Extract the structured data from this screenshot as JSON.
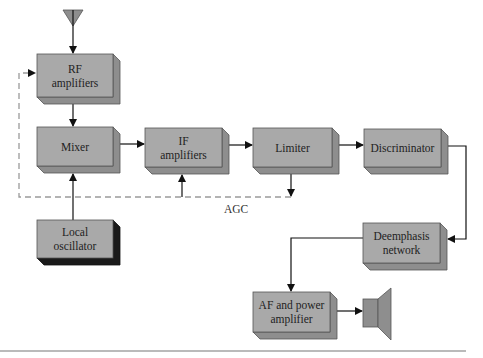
{
  "diagram": {
    "colors": {
      "block_front": "#a9a9a9",
      "block_side": "#8e8e8e",
      "oscillator_side": "#1a1a1a",
      "wire": "#111111",
      "agc_dashed": "#9a9a9a"
    },
    "blocks": [
      {
        "id": "rf",
        "lines": [
          "RF",
          "amplifiers"
        ],
        "x": 37,
        "y": 54,
        "w": 76,
        "h": 43,
        "dark": false
      },
      {
        "id": "mixer",
        "lines": [
          "Mixer"
        ],
        "x": 37,
        "y": 127,
        "w": 76,
        "h": 39,
        "dark": false
      },
      {
        "id": "if",
        "lines": [
          "IF",
          "amplifiers"
        ],
        "x": 145,
        "y": 128,
        "w": 77,
        "h": 39,
        "dark": false
      },
      {
        "id": "limiter",
        "lines": [
          "Limiter"
        ],
        "x": 253,
        "y": 128,
        "w": 79,
        "h": 39,
        "dark": false
      },
      {
        "id": "discriminator",
        "lines": [
          "Discriminator"
        ],
        "x": 364,
        "y": 129,
        "w": 77,
        "h": 38,
        "dark": false
      },
      {
        "id": "local-oscillator",
        "lines": [
          "Local",
          "oscillator"
        ],
        "x": 37,
        "y": 220,
        "w": 76,
        "h": 38,
        "dark": true
      },
      {
        "id": "deemphasis",
        "lines": [
          "Deemphasis",
          "network"
        ],
        "x": 363,
        "y": 223,
        "w": 77,
        "h": 40,
        "dark": false
      },
      {
        "id": "af-amp",
        "lines": [
          "AF and power",
          "amplifier"
        ],
        "x": 253,
        "y": 292,
        "w": 77,
        "h": 40,
        "dark": false
      }
    ],
    "agc_label": "AGC",
    "connections": [
      "antenna -> RF amplifiers",
      "RF amplifiers -> Mixer",
      "Local oscillator -> Mixer",
      "Mixer -> IF amplifiers",
      "IF amplifiers -> Limiter",
      "Limiter -> Discriminator",
      "Discriminator -> Deemphasis network",
      "Deemphasis network -> AF and power amplifier",
      "AF and power amplifier -> Speaker",
      "Limiter -> AGC -> IF amplifiers (dashed)",
      "Limiter -> AGC -> RF amplifiers (dashed)"
    ]
  }
}
